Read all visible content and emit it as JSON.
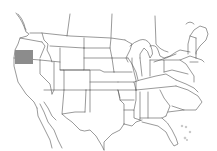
{
  "map": {
    "type": "outline-map",
    "region": "United States (contiguous) with partial Canada and Mexico",
    "background_color": "#ffffff",
    "line_color": "#555555",
    "highlight": {
      "label": "highlighted-region",
      "location": "Southern Oregon",
      "color": "#8c8c8c",
      "bbox": {
        "x": 15,
        "y": 50,
        "width": 18,
        "height": 14
      }
    },
    "features": [
      "state-boundaries",
      "canada-provincial-boundaries",
      "mexico-outline",
      "great-lakes",
      "bahamas-islands"
    ]
  }
}
